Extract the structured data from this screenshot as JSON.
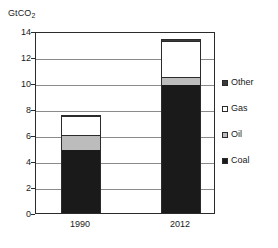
{
  "chart_data": {
    "type": "bar",
    "stacked": true,
    "title": "",
    "unit_label": "GtCO",
    "unit_label_sub": "2",
    "xlabel": "",
    "ylabel": "GtCO2",
    "ylim": [
      0,
      14
    ],
    "ytick_step": 2,
    "grid": true,
    "legend_position": "right",
    "categories": [
      "1990",
      "2012"
    ],
    "yticks": [
      "14",
      "12",
      "10",
      "8",
      "6",
      "4",
      "2",
      "0"
    ],
    "series": [
      {
        "name": "Coal",
        "color": "#1a1a1a",
        "values": [
          4.85,
          9.85
        ]
      },
      {
        "name": "Oil",
        "color": "#bcbcbc",
        "values": [
          1.15,
          0.65
        ]
      },
      {
        "name": "Gas",
        "color": "#ffffff",
        "values": [
          1.45,
          2.75
        ]
      },
      {
        "name": "Other",
        "color": "#3a3a3a",
        "values": [
          0.1,
          0.15
        ]
      }
    ],
    "totals": [
      7.55,
      13.4
    ],
    "legend_entries": [
      {
        "label": "Other",
        "color": "#3a3a3a"
      },
      {
        "label": "Gas",
        "color": "#ffffff"
      },
      {
        "label": "Oil",
        "color": "#bcbcbc"
      },
      {
        "label": "Coal",
        "color": "#1a1a1a"
      }
    ]
  }
}
